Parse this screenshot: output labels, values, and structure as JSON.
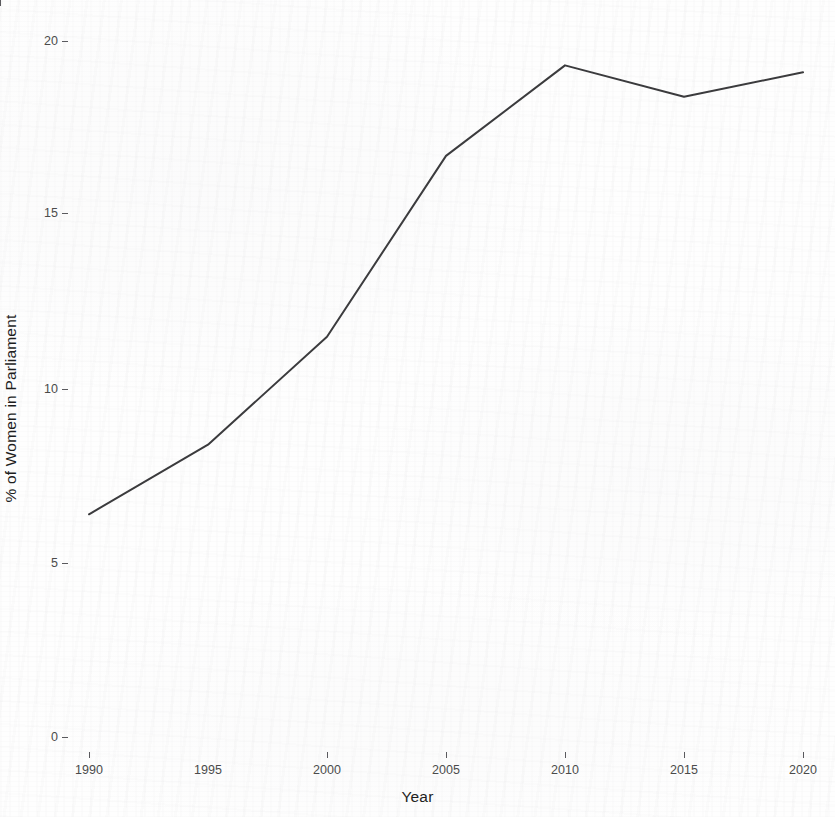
{
  "chart_data": {
    "type": "line",
    "title": "",
    "subtitle": "",
    "xlabel": "Year",
    "ylabel": "% of Women in Parliament",
    "x": [
      1990,
      1995,
      2000,
      2005,
      2010,
      2015,
      2020
    ],
    "values": [
      6.4,
      8.4,
      11.5,
      16.7,
      19.3,
      18.4,
      19.1
    ],
    "series": [
      {
        "name": "% of Women in Parliament",
        "values": [
          6.4,
          8.4,
          11.5,
          16.7,
          19.3,
          18.4,
          19.1
        ]
      }
    ],
    "xlim": [
      1988.5,
      2021.5
    ],
    "ylim": [
      -0.5,
      20.8
    ],
    "x_tick_labels": [
      "1990",
      "1995",
      "2000",
      "2005",
      "2010",
      "2015",
      "2020"
    ],
    "y_tick_labels": [
      "0",
      "5",
      "10",
      "15",
      "20"
    ],
    "y_ticks": [
      0,
      5,
      10,
      15,
      20
    ],
    "grid": false,
    "legend": false,
    "legend_position": "none",
    "line_color": "#3a3a3c",
    "line_width": 2,
    "markers": false,
    "background_color": "#ffffff",
    "annotations": []
  },
  "axes": {
    "y_title": "% of Women in Parliament",
    "x_title": "Year"
  }
}
